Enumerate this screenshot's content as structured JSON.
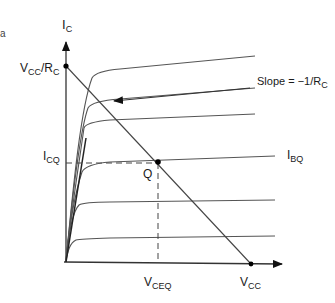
{
  "diagram": {
    "edge_fragment": "a",
    "axes": {
      "y_axis": {
        "label_main": "I",
        "label_sub": "C"
      },
      "x_axis_ticks": [
        {
          "main": "V",
          "sub": "CEQ"
        },
        {
          "main": "V",
          "sub": "CC"
        }
      ]
    },
    "labels": {
      "vcc_over_rc": {
        "main": "V",
        "sub1": "CC",
        "mid": "/R",
        "sub2": "C"
      },
      "icq": {
        "main": "I",
        "sub": "CQ"
      },
      "ibq": {
        "main": "I",
        "sub": "BQ"
      },
      "q_point": "Q",
      "slope": {
        "main": "Slope = −1/R",
        "sub": "C"
      }
    },
    "curves": {
      "count": 6,
      "description": "collector characteristic curves for increasing base current"
    },
    "colors": {
      "line": "#555555",
      "axis": "#333333",
      "dot": "#000000"
    }
  }
}
